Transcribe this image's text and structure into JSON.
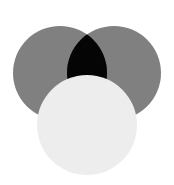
{
  "figure": {
    "background_color": "#ffffff",
    "width": 174,
    "height": 185
  },
  "chart_data": {
    "type": "venn",
    "subtitle": "",
    "xlabel": "",
    "ylabel": "",
    "background": "#ffffff",
    "grid": false,
    "legend": null,
    "annotations": [],
    "blend_mode": "multiply",
    "sets": [
      {
        "name": "left-circle",
        "label": "",
        "cx": 60,
        "cy": 73,
        "r": 47,
        "fill": "#808080",
        "opacity": 1,
        "z": 1
      },
      {
        "name": "right-circle",
        "label": "",
        "cx": 114,
        "cy": 73,
        "r": 47,
        "fill": "#808080",
        "opacity": 1,
        "z": 2
      },
      {
        "name": "bottom-circle",
        "label": "",
        "cx": 87,
        "cy": 125,
        "r": 50,
        "fill": "#ededed",
        "opacity": 1,
        "z": 3
      }
    ],
    "regions": [
      {
        "name": "left-only",
        "color": "#808080"
      },
      {
        "name": "right-only",
        "color": "#808080"
      },
      {
        "name": "left-and-right",
        "color": "#141414"
      },
      {
        "name": "bottom-only",
        "color": "#ededed"
      },
      {
        "name": "bottom-over-all",
        "color": "#ededed"
      }
    ]
  }
}
